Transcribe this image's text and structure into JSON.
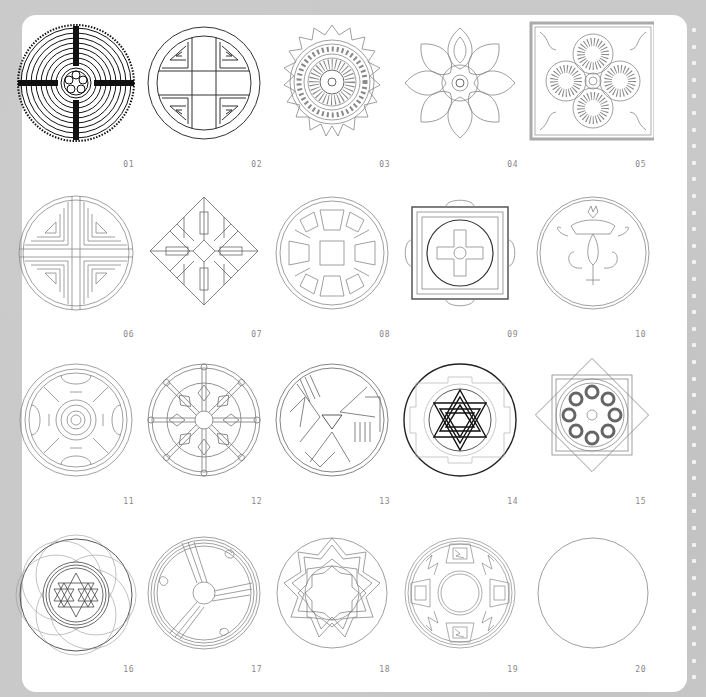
{
  "page": {
    "background_color": "#c9c9c9",
    "card_color": "#ffffff",
    "label_color": "#888888",
    "line_color": "#8a8a8a",
    "dark_line_color": "#222222"
  },
  "binding_dots": {
    "count": 40
  },
  "mandalas": [
    {
      "number": "01",
      "motif": "labyrinth-circle"
    },
    {
      "number": "02",
      "motif": "fret-cross-circle"
    },
    {
      "number": "03",
      "motif": "star-lotus-rosette"
    },
    {
      "number": "04",
      "motif": "floral-eight-petal"
    },
    {
      "number": "05",
      "motif": "square-floral-tile"
    },
    {
      "number": "06",
      "motif": "concentric-quadrant-circle"
    },
    {
      "number": "07",
      "motif": "diamond-geometric"
    },
    {
      "number": "08",
      "motif": "interlace-wheel"
    },
    {
      "number": "09",
      "motif": "tibetan-square-mandala"
    },
    {
      "number": "10",
      "motif": "lotus-flower-circle"
    },
    {
      "number": "11",
      "motif": "ornamental-cross-circle"
    },
    {
      "number": "12",
      "motif": "dharma-wheel"
    },
    {
      "number": "13",
      "motif": "tribal-bird-circle"
    },
    {
      "number": "14",
      "motif": "sri-yantra"
    },
    {
      "number": "15",
      "motif": "eight-point-star-medallion"
    },
    {
      "number": "16",
      "motif": "star-grid-lattice-circle"
    },
    {
      "number": "17",
      "motif": "triskele-spiral-ring"
    },
    {
      "number": "18",
      "motif": "zigzag-ring"
    },
    {
      "number": "19",
      "motif": "pueblo-pottery-ring"
    },
    {
      "number": "20",
      "motif": "blank-circle"
    }
  ]
}
